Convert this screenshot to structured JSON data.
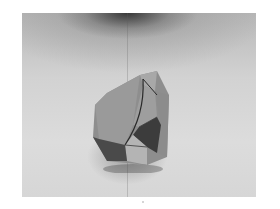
{
  "image": {
    "subject": "crystal specimen photograph",
    "style": "grayscale halftone",
    "colors": {
      "background_light": "#dcdcdc",
      "shadow_top": "#3a3a3a",
      "facet_mid": "#8a8a8a",
      "facet_dark": "#3c3c3c",
      "facet_light": "#b0b0b0"
    }
  }
}
